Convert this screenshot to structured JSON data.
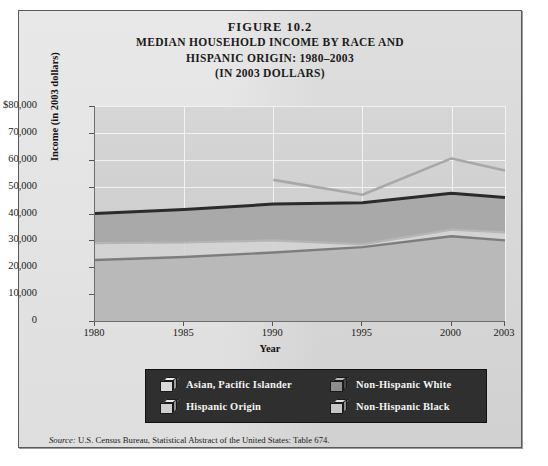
{
  "figure": {
    "number_line": "FIGURE 10.2",
    "title_line_1": "MEDIAN HOUSEHOLD INCOME BY RACE AND",
    "title_line_2": "HISPANIC ORIGIN: 1980–2003",
    "title_line_3": "(IN 2003 DOLLARS)",
    "source_prefix": "Source:",
    "source_text": " U.S. Census Bureau, Statistical Abstract of the United States: Table 674."
  },
  "colors": {
    "page_background": "#ffffff",
    "figure_background": "#dcdcdc",
    "plot_background": "#cfcfcf",
    "gridline": "#f2f2f2",
    "axis": "#6e6e6e",
    "legend_background": "#2f2f2f",
    "legend_text": "#f4f4f4",
    "asian_pacific_islander": "#a8a8a8",
    "hispanic_origin": "#b5b5b5",
    "non_hispanic_white": "#2b2b2b",
    "non_hispanic_black": "#7d7d7d",
    "band_upper_fill": "#d8d8d8",
    "band_white_black_fill": "#a9a9a9",
    "band_lower_fill": "#b9b9b9"
  },
  "chart_data": {
    "type": "line",
    "title": "MEDIAN HOUSEHOLD INCOME BY RACE AND HISPANIC ORIGIN: 1980–2003 (IN 2003 DOLLARS)",
    "xlabel": "Year",
    "ylabel": "Income (in 2003 dollars)",
    "x": [
      1980,
      1985,
      1990,
      1995,
      2000,
      2003
    ],
    "xtick_labels": [
      "1980",
      "1985",
      "1990",
      "1995",
      "2000",
      "2003"
    ],
    "ytick_labels": [
      "$80,000",
      "70,000",
      "60,000",
      "50,000",
      "40,000",
      "30,000",
      "20,000",
      "10,000",
      "0"
    ],
    "ytick_values": [
      80000,
      70000,
      60000,
      50000,
      40000,
      30000,
      20000,
      10000,
      0
    ],
    "ylim": [
      0,
      80000
    ],
    "xlim": [
      1980,
      2003
    ],
    "grid": true,
    "legend_position": "bottom",
    "series": [
      {
        "name": "Asian, Pacific Islander",
        "color": "#a8a8a8",
        "x": [
          1990,
          1995,
          2000,
          2003
        ],
        "values": [
          52500,
          47000,
          60500,
          56000
        ]
      },
      {
        "name": "Hispanic Origin",
        "color": "#b5b5b5",
        "x": [
          1980,
          1985,
          1990,
          1995,
          2000,
          2003
        ],
        "values": [
          29000,
          29200,
          30000,
          28500,
          34000,
          33000
        ]
      },
      {
        "name": "Non-Hispanic White",
        "color": "#2b2b2b",
        "x": [
          1980,
          1985,
          1990,
          1995,
          2000,
          2003
        ],
        "values": [
          40000,
          41500,
          43500,
          44000,
          47500,
          46000
        ]
      },
      {
        "name": "Non-Hispanic Black",
        "color": "#7d7d7d",
        "x": [
          1980,
          1985,
          1990,
          1995,
          2000,
          2003
        ],
        "values": [
          22700,
          23800,
          25500,
          27500,
          31500,
          30000
        ]
      }
    ]
  },
  "legend": {
    "items": [
      {
        "label": "Asian, Pacific Islander",
        "swatch_front": "#d9d9d9",
        "swatch_top": "#efefef",
        "swatch_side": "#9d9d9d"
      },
      {
        "label": "Hispanic Origin",
        "swatch_front": "#cfcfcf",
        "swatch_top": "#e8e8e8",
        "swatch_side": "#8f8f8f"
      },
      {
        "label": "Non-Hispanic White",
        "swatch_front": "#8d8d8d",
        "swatch_top": "#b8b8b8",
        "swatch_side": "#4a4a4a"
      },
      {
        "label": "Non-Hispanic Black",
        "swatch_front": "#c6c6c6",
        "swatch_top": "#e0e0e0",
        "swatch_side": "#898989"
      }
    ]
  }
}
